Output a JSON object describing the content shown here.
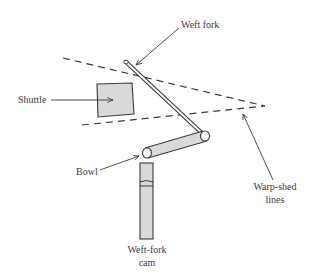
{
  "diagram": {
    "type": "mechanism-schematic",
    "labels": {
      "weft_fork": "Weft fork",
      "shuttle": "Shuttle",
      "bowl": "Bowl",
      "warp_shed_line1": "Warp-shed",
      "warp_shed_line2": "lines",
      "weft_fork_cam_line1": "Weft-fork",
      "weft_fork_cam_line2": "cam"
    },
    "colors": {
      "line": "#3a3a3a",
      "fill": "#d9d9d9",
      "background": "#ffffff",
      "text": "#3a3a3a"
    },
    "components": [
      {
        "name": "Weft fork",
        "shape": "rod"
      },
      {
        "name": "Shuttle",
        "shape": "square"
      },
      {
        "name": "Bowl",
        "shape": "rod-end"
      },
      {
        "name": "Weft-fork cam",
        "shape": "vertical bar"
      },
      {
        "name": "Warp-shed lines",
        "shape": "two dashed converging lines"
      }
    ]
  }
}
